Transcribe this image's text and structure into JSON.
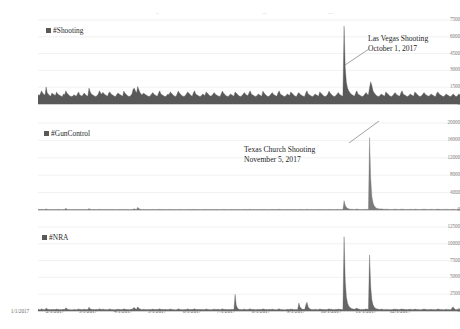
{
  "chart_data": [
    {
      "type": "area",
      "title": "",
      "series_name": "#Shooting",
      "legend_label": "#Shooting",
      "legend_position": "top-left-inside",
      "xlabel": "",
      "ylabel": "",
      "ylim": [
        0,
        7500
      ],
      "yticks": [
        0,
        1500,
        3000,
        4500,
        6000,
        7500
      ],
      "grid": true,
      "color": "#595959",
      "annotations": [
        {
          "text_line_1": "Las Vegas Shooting",
          "text_line_2": "October 1, 2017",
          "points_to_x": "10/1/2017",
          "leader": "diagonal-line"
        }
      ],
      "x_start": "1/1/2017",
      "x_end": "12/31/2017",
      "x_interval": "daily",
      "values": [
        820,
        760,
        900,
        1180,
        980,
        860,
        790,
        1520,
        1010,
        880,
        760,
        700,
        980,
        900,
        820,
        760,
        1080,
        900,
        820,
        760,
        700,
        680,
        900,
        820,
        1190,
        980,
        860,
        760,
        700,
        680,
        720,
        820,
        760,
        700,
        900,
        1080,
        820,
        760,
        700,
        860,
        980,
        820,
        760,
        700,
        1420,
        1100,
        900,
        820,
        760,
        700,
        680,
        760,
        900,
        1180,
        980,
        860,
        1050,
        900,
        820,
        760,
        700,
        980,
        1080,
        900,
        820,
        760,
        700,
        680,
        860,
        980,
        900,
        820,
        760,
        700,
        1150,
        980,
        860,
        760,
        700,
        680,
        760,
        900,
        1300,
        1420,
        1180,
        980,
        1560,
        1280,
        1020,
        880,
        820,
        980,
        900,
        820,
        760,
        700,
        680,
        760,
        900,
        1020,
        880,
        800,
        740,
        700,
        980,
        1180,
        900,
        820,
        760,
        700,
        680,
        760,
        900,
        820,
        1080,
        980,
        860,
        760,
        700,
        680,
        900,
        1150,
        980,
        860,
        760,
        700,
        680,
        760,
        900,
        1080,
        980,
        860,
        760,
        700,
        980,
        1180,
        900,
        820,
        760,
        700,
        680,
        760,
        900,
        820,
        760,
        1080,
        980,
        860,
        760,
        700,
        760,
        900,
        1020,
        880,
        800,
        740,
        700,
        680,
        900,
        1150,
        980,
        860,
        760,
        700,
        680,
        760,
        900,
        820,
        760,
        700,
        1080,
        980,
        860,
        760,
        700,
        680,
        760,
        900,
        1020,
        880,
        800,
        740,
        980,
        1180,
        900,
        820,
        760,
        700,
        680,
        760,
        900,
        820,
        760,
        700,
        1150,
        980,
        860,
        760,
        700,
        680,
        760,
        900,
        1020,
        880,
        800,
        740,
        700,
        980,
        1180,
        900,
        820,
        760,
        700,
        680,
        760,
        900,
        820,
        760,
        1080,
        980,
        860,
        760,
        700,
        680,
        900,
        1020,
        880,
        800,
        740,
        700,
        680,
        980,
        1180,
        900,
        820,
        760,
        700,
        680,
        760,
        900,
        820,
        760,
        700,
        1080,
        980,
        860,
        760,
        700,
        680,
        760,
        900,
        1150,
        980,
        860,
        760,
        700,
        680,
        760,
        900,
        1020,
        880,
        800,
        740,
        700,
        6950,
        3250,
        1950,
        1420,
        1180,
        1020,
        900,
        820,
        760,
        700,
        980,
        1180,
        900,
        820,
        760,
        700,
        680,
        760,
        900,
        1020,
        880,
        800,
        1480,
        1980,
        1620,
        1180,
        980,
        860,
        760,
        700,
        680,
        760,
        900,
        820,
        760,
        700,
        1080,
        980,
        860,
        760,
        700,
        680,
        760,
        900,
        1020,
        880,
        800,
        740,
        700,
        980,
        1180,
        900,
        820,
        760,
        700,
        680,
        760,
        900,
        820,
        760,
        700,
        1080,
        980,
        860,
        760,
        700,
        680,
        760,
        900,
        1020,
        880,
        800,
        740,
        700,
        760,
        900,
        820,
        760,
        700,
        680,
        980,
        1080,
        900,
        820,
        760,
        700,
        680,
        760,
        900,
        820,
        760,
        700,
        680,
        760,
        900,
        820,
        700,
        680,
        760,
        900,
        820
      ]
    },
    {
      "type": "area",
      "title": "",
      "series_name": "#GunControl",
      "legend_label": "#GunControl",
      "legend_position": "top-left-inside",
      "xlabel": "",
      "ylabel": "",
      "ylim": [
        0,
        20000
      ],
      "yticks": [
        0,
        4000,
        8000,
        12000,
        16000,
        20000
      ],
      "grid": true,
      "color": "#7a7a7a",
      "annotations": [
        {
          "text_line_1": "Texas Church Shooting",
          "text_line_2": "November 5, 2017",
          "points_to_x": "11/5/2017",
          "leader": "diagonal-line"
        }
      ],
      "x_start": "1/1/2017",
      "x_end": "12/31/2017",
      "x_interval": "daily",
      "values": [
        120,
        100,
        90,
        160,
        110,
        95,
        90,
        260,
        140,
        100,
        90,
        85,
        110,
        100,
        95,
        90,
        130,
        100,
        95,
        90,
        85,
        80,
        100,
        95,
        420,
        180,
        110,
        95,
        90,
        85,
        90,
        100,
        95,
        90,
        110,
        130,
        100,
        95,
        90,
        100,
        120,
        100,
        95,
        90,
        340,
        160,
        110,
        100,
        95,
        90,
        85,
        95,
        110,
        150,
        120,
        100,
        130,
        110,
        100,
        95,
        90,
        120,
        130,
        110,
        100,
        95,
        90,
        85,
        100,
        120,
        110,
        100,
        95,
        90,
        140,
        120,
        100,
        95,
        90,
        85,
        95,
        110,
        180,
        260,
        160,
        120,
        620,
        320,
        180,
        130,
        110,
        120,
        110,
        100,
        95,
        90,
        85,
        95,
        110,
        130,
        110,
        100,
        95,
        90,
        120,
        150,
        110,
        100,
        95,
        90,
        85,
        95,
        110,
        100,
        130,
        120,
        100,
        95,
        90,
        85,
        110,
        140,
        120,
        100,
        95,
        90,
        85,
        95,
        110,
        130,
        120,
        100,
        95,
        90,
        120,
        150,
        110,
        100,
        95,
        90,
        85,
        95,
        110,
        100,
        95,
        130,
        120,
        100,
        95,
        90,
        95,
        110,
        130,
        110,
        100,
        95,
        90,
        85,
        110,
        140,
        120,
        100,
        95,
        90,
        85,
        95,
        110,
        100,
        95,
        90,
        130,
        120,
        100,
        95,
        90,
        85,
        95,
        110,
        130,
        110,
        100,
        95,
        120,
        150,
        110,
        100,
        95,
        90,
        85,
        95,
        110,
        100,
        95,
        90,
        140,
        120,
        100,
        95,
        90,
        85,
        95,
        110,
        130,
        110,
        100,
        95,
        90,
        120,
        150,
        110,
        100,
        95,
        90,
        85,
        95,
        110,
        100,
        95,
        130,
        120,
        100,
        95,
        90,
        85,
        110,
        130,
        110,
        100,
        95,
        90,
        85,
        120,
        150,
        110,
        100,
        95,
        90,
        85,
        95,
        110,
        100,
        95,
        90,
        130,
        120,
        100,
        95,
        90,
        85,
        95,
        110,
        140,
        120,
        100,
        95,
        90,
        85,
        95,
        110,
        130,
        110,
        100,
        95,
        90,
        2150,
        1100,
        620,
        380,
        260,
        200,
        170,
        150,
        130,
        120,
        180,
        220,
        160,
        130,
        120,
        110,
        100,
        110,
        130,
        150,
        130,
        120,
        16650,
        7200,
        3100,
        1650,
        980,
        620,
        420,
        320,
        260,
        220,
        260,
        210,
        180,
        160,
        190,
        170,
        150,
        140,
        130,
        120,
        130,
        150,
        170,
        150,
        140,
        130,
        120,
        160,
        190,
        150,
        140,
        130,
        120,
        110,
        130,
        150,
        140,
        130,
        120,
        170,
        150,
        140,
        130,
        120,
        110,
        130,
        150,
        170,
        150,
        140,
        130,
        120,
        130,
        150,
        140,
        130,
        120,
        110,
        160,
        170,
        150,
        140,
        130,
        120,
        110,
        130,
        150,
        140,
        130,
        120,
        110,
        130,
        150,
        140,
        120,
        110,
        130,
        150,
        140
      ]
    },
    {
      "type": "area",
      "title": "",
      "series_name": "#NRA",
      "legend_label": "#NRA",
      "legend_position": "top-left-inside",
      "xlabel": "",
      "ylabel": "",
      "ylim": [
        0,
        12500
      ],
      "yticks": [
        0,
        2500,
        5000,
        7500,
        10000,
        12500
      ],
      "grid": true,
      "color": "#666666",
      "annotations": [],
      "x_start": "1/1/2017",
      "x_end": "12/31/2017",
      "x_interval": "daily",
      "values": [
        260,
        220,
        200,
        340,
        240,
        210,
        200,
        430,
        290,
        230,
        210,
        195,
        240,
        220,
        210,
        200,
        300,
        220,
        210,
        200,
        190,
        185,
        220,
        210,
        480,
        330,
        240,
        210,
        200,
        190,
        200,
        220,
        210,
        200,
        240,
        300,
        220,
        210,
        200,
        230,
        260,
        220,
        210,
        200,
        560,
        340,
        240,
        220,
        210,
        200,
        190,
        210,
        240,
        330,
        260,
        220,
        290,
        240,
        220,
        210,
        200,
        260,
        300,
        240,
        220,
        210,
        200,
        190,
        230,
        260,
        240,
        220,
        210,
        200,
        320,
        260,
        230,
        210,
        200,
        190,
        210,
        240,
        420,
        520,
        340,
        260,
        620,
        420,
        280,
        240,
        220,
        260,
        240,
        220,
        210,
        200,
        190,
        210,
        240,
        280,
        240,
        220,
        210,
        200,
        260,
        340,
        240,
        220,
        210,
        200,
        190,
        210,
        240,
        220,
        300,
        260,
        230,
        210,
        200,
        190,
        240,
        320,
        260,
        230,
        210,
        200,
        190,
        210,
        240,
        300,
        260,
        230,
        210,
        200,
        260,
        340,
        240,
        220,
        210,
        200,
        190,
        210,
        240,
        220,
        210,
        300,
        260,
        230,
        210,
        200,
        210,
        240,
        280,
        240,
        220,
        210,
        200,
        190,
        240,
        320,
        260,
        230,
        210,
        200,
        190,
        210,
        240,
        220,
        210,
        200,
        2480,
        900,
        460,
        300,
        240,
        210,
        210,
        240,
        280,
        240,
        220,
        210,
        260,
        340,
        240,
        220,
        210,
        200,
        190,
        210,
        240,
        220,
        210,
        200,
        320,
        260,
        230,
        210,
        200,
        190,
        210,
        240,
        280,
        240,
        220,
        210,
        200,
        260,
        340,
        240,
        220,
        210,
        200,
        190,
        210,
        240,
        220,
        210,
        300,
        260,
        230,
        210,
        200,
        190,
        240,
        1180,
        620,
        380,
        280,
        240,
        220,
        900,
        1320,
        640,
        380,
        280,
        240,
        210,
        230,
        260,
        240,
        220,
        210,
        300,
        260,
        230,
        210,
        200,
        190,
        210,
        240,
        320,
        260,
        230,
        210,
        200,
        190,
        210,
        240,
        280,
        240,
        220,
        210,
        200,
        11050,
        4600,
        2100,
        1180,
        760,
        540,
        420,
        340,
        300,
        260,
        360,
        420,
        320,
        270,
        240,
        220,
        210,
        230,
        260,
        300,
        260,
        240,
        8350,
        3600,
        1650,
        920,
        600,
        420,
        330,
        280,
        250,
        230,
        280,
        250,
        230,
        220,
        240,
        230,
        220,
        210,
        200,
        200,
        220,
        250,
        270,
        250,
        230,
        220,
        210,
        260,
        300,
        250,
        230,
        220,
        210,
        200,
        220,
        250,
        240,
        220,
        210,
        280,
        250,
        230,
        220,
        210,
        200,
        220,
        250,
        280,
        250,
        230,
        220,
        210,
        220,
        250,
        240,
        220,
        210,
        200,
        260,
        280,
        250,
        230,
        220,
        210,
        200,
        220,
        250,
        240,
        220,
        210,
        200,
        420,
        620,
        380,
        230,
        210,
        240,
        260,
        240
      ]
    }
  ],
  "xaxis": {
    "labels": [
      "1/1/2017",
      "2/1/2017",
      "3/1/2017",
      "4/1/2017",
      "5/1/2017",
      "6/1/2017",
      "7/1/2017",
      "8/1/2017",
      "9/1/2017",
      "10/1/2017",
      "11/1/2017",
      "12/1/2017"
    ]
  },
  "colors": {
    "series_shooting": "#595959",
    "series_guncontrol": "#7a7a7a",
    "series_nra": "#666666",
    "gridline": "#e3e3e3",
    "tick_text": "#6f6f6f",
    "annotation_text": "#1d1d1d",
    "background": "#ffffff"
  }
}
